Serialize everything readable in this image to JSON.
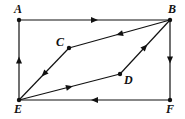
{
  "diagram": {
    "type": "directed-graph",
    "nodes": [
      {
        "id": "A",
        "label": "A",
        "x": 19,
        "y": 20,
        "lx": 14,
        "ly": 13
      },
      {
        "id": "B",
        "label": "B",
        "x": 170,
        "y": 20,
        "lx": 168,
        "ly": 13
      },
      {
        "id": "C",
        "label": "C",
        "x": 69,
        "y": 48,
        "lx": 56,
        "ly": 46
      },
      {
        "id": "D",
        "label": "D",
        "x": 120,
        "y": 74,
        "lx": 124,
        "ly": 84
      },
      {
        "id": "E",
        "label": "E",
        "x": 19,
        "y": 100,
        "lx": 14,
        "ly": 113
      },
      {
        "id": "F",
        "label": "F",
        "x": 170,
        "y": 100,
        "lx": 166,
        "ly": 113
      }
    ],
    "edges": [
      {
        "from": "A",
        "to": "B"
      },
      {
        "from": "B",
        "to": "C"
      },
      {
        "from": "C",
        "to": "E"
      },
      {
        "from": "E",
        "to": "D"
      },
      {
        "from": "D",
        "to": "B"
      },
      {
        "from": "B",
        "to": "F"
      },
      {
        "from": "F",
        "to": "E"
      },
      {
        "from": "E",
        "to": "A"
      }
    ],
    "colors": {
      "stroke": "#111111",
      "background": "#ffffff"
    }
  }
}
